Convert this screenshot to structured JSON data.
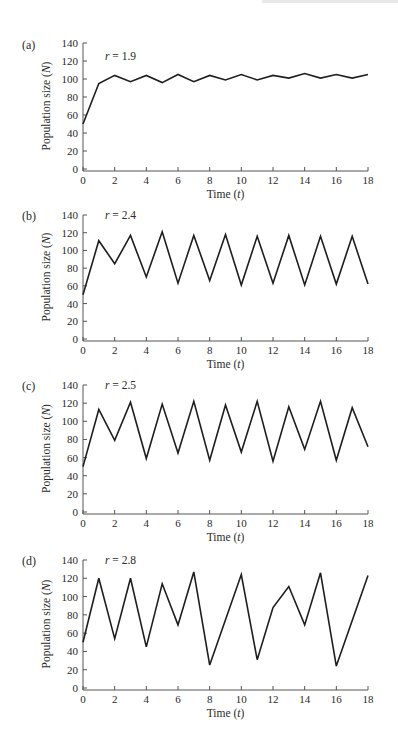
{
  "chart_data": [
    {
      "type": "line",
      "panel": "(a)",
      "annotation": "r = 1.9",
      "xlabel": "Time (t)",
      "ylabel": "Population size (N)",
      "xlim": [
        0,
        18
      ],
      "ylim": [
        0,
        140
      ],
      "xticks": [
        0,
        2,
        4,
        6,
        8,
        10,
        12,
        14,
        16,
        18
      ],
      "yticks": [
        0,
        20,
        40,
        60,
        80,
        100,
        120,
        140
      ],
      "grid": false,
      "x": [
        0,
        1,
        2,
        3,
        4,
        5,
        6,
        7,
        8,
        9,
        10,
        11,
        12,
        13,
        14,
        15,
        16,
        17,
        18
      ],
      "values": [
        50,
        95,
        104,
        97,
        104,
        96,
        105,
        97,
        104,
        99,
        105,
        99,
        104,
        101,
        106,
        101,
        105,
        101,
        105
      ]
    },
    {
      "type": "line",
      "panel": "(b)",
      "annotation": "r = 2.4",
      "xlabel": "Time (t)",
      "ylabel": "Population size (N)",
      "xlim": [
        0,
        18
      ],
      "ylim": [
        0,
        140
      ],
      "xticks": [
        0,
        2,
        4,
        6,
        8,
        10,
        12,
        14,
        16,
        18
      ],
      "yticks": [
        0,
        20,
        40,
        60,
        80,
        100,
        120,
        140
      ],
      "grid": false,
      "x": [
        0,
        1,
        2,
        3,
        4,
        5,
        6,
        7,
        8,
        9,
        10,
        11,
        12,
        13,
        14,
        15,
        16,
        17,
        18
      ],
      "values": [
        50,
        111,
        85,
        117,
        70,
        121,
        63,
        117,
        66,
        118,
        61,
        116,
        63,
        117,
        61,
        116,
        62,
        116,
        62
      ]
    },
    {
      "type": "line",
      "panel": "(c)",
      "annotation": "r = 2.5",
      "xlabel": "Time (t)",
      "ylabel": "Population size (N)",
      "xlim": [
        0,
        18
      ],
      "ylim": [
        0,
        140
      ],
      "xticks": [
        0,
        2,
        4,
        6,
        8,
        10,
        12,
        14,
        16,
        18
      ],
      "yticks": [
        0,
        20,
        40,
        60,
        80,
        100,
        120,
        140
      ],
      "grid": false,
      "x": [
        0,
        1,
        2,
        3,
        4,
        5,
        6,
        7,
        8,
        9,
        10,
        11,
        12,
        13,
        14,
        15,
        16,
        17,
        18
      ],
      "values": [
        50,
        113,
        79,
        121,
        59,
        119,
        65,
        122,
        57,
        118,
        66,
        122,
        56,
        116,
        69,
        122,
        57,
        115,
        72
      ]
    },
    {
      "type": "line",
      "panel": "(d)",
      "annotation": "r = 2.8",
      "xlabel": "Time (t)",
      "ylabel": "Population size (N)",
      "xlim": [
        0,
        18
      ],
      "ylim": [
        0,
        140
      ],
      "xticks": [
        0,
        2,
        4,
        6,
        8,
        10,
        12,
        14,
        16,
        18
      ],
      "yticks": [
        0,
        20,
        40,
        60,
        80,
        100,
        120,
        140
      ],
      "grid": false,
      "x": [
        0,
        1,
        2,
        3,
        4,
        5,
        6,
        7,
        8,
        10,
        11,
        12,
        13,
        14,
        15,
        16,
        18
      ],
      "values": [
        50,
        120,
        54,
        120,
        45,
        114,
        69,
        127,
        25,
        124,
        31,
        88,
        111,
        69,
        126,
        24,
        123
      ]
    }
  ],
  "panels": [
    {
      "label": "(a)",
      "annotation_r": "r",
      "annotation_val": " = 1.9"
    },
    {
      "label": "(b)",
      "annotation_r": "r",
      "annotation_val": " = 2.4"
    },
    {
      "label": "(c)",
      "annotation_r": "r",
      "annotation_val": " = 2.5"
    },
    {
      "label": "(d)",
      "annotation_r": "r",
      "annotation_val": " = 2.8"
    }
  ],
  "axis": {
    "xlabel_main": "Time (",
    "xlabel_var": "t",
    "xlabel_close": ")",
    "ylabel_main": "Population size (",
    "ylabel_var": "N",
    "ylabel_close": ")"
  },
  "colors": {
    "line": "#1e1e1e",
    "axis": "#555555",
    "text": "#2a2a2a"
  }
}
